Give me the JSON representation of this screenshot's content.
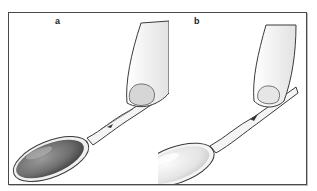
{
  "figure": {
    "panels": [
      {
        "id": "a",
        "label": "a",
        "bowl_fill": "#6e6e6e",
        "description": "finger presses spoon handle end; bowl filled dark"
      },
      {
        "id": "b",
        "label": "b",
        "bowl_fill": "#e4e4e4",
        "description": "finger presses spoon handle end; bowl light/empty"
      }
    ],
    "colors": {
      "border": "#4a4a4a",
      "outline": "#3a3a3a",
      "finger": "#f2f2f2",
      "nail": "#d6d6d6"
    }
  }
}
